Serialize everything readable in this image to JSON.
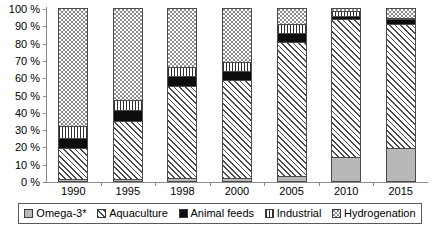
{
  "chart_data": {
    "type": "bar",
    "stacked": true,
    "title": "",
    "subtitle": "",
    "xlabel": "",
    "ylabel": "",
    "categories": [
      "1990",
      "1995",
      "1998",
      "2000",
      "2005",
      "2010",
      "2015"
    ],
    "ylim": [
      0,
      100
    ],
    "y_unit": "%",
    "y_ticks": [
      "0 %",
      "10 %",
      "20 %",
      "30 %",
      "40 %",
      "50 %",
      "60 %",
      "70 %",
      "80 %",
      "90 %",
      "100 %"
    ],
    "y_tick_values": [
      0,
      10,
      20,
      30,
      40,
      50,
      60,
      70,
      80,
      90,
      100
    ],
    "grid": false,
    "legend_position": "bottom",
    "series": [
      {
        "name": "Omega-3*",
        "fill": "omega3",
        "values": [
          1,
          1,
          2,
          2,
          3,
          14,
          19
        ]
      },
      {
        "name": "Aquaculture",
        "fill": "aquaculture",
        "values": [
          18,
          34,
          53,
          57,
          78,
          80,
          72
        ]
      },
      {
        "name": "Animal feeds",
        "fill": "animalfeeds",
        "values": [
          6,
          6,
          6,
          5,
          5,
          2,
          3
        ]
      },
      {
        "name": "Industrial",
        "fill": "industrial",
        "values": [
          7,
          6,
          5,
          5,
          5,
          3,
          1
        ]
      },
      {
        "name": "Hydrogenation",
        "fill": "hydrogenation",
        "values": [
          68,
          53,
          34,
          31,
          9,
          1,
          5
        ]
      }
    ],
    "legend": [
      {
        "label": "Omega-3*",
        "fill": "omega3"
      },
      {
        "label": "Aquaculture",
        "fill": "aquaculture"
      },
      {
        "label": "Animal feeds",
        "fill": "animalfeeds"
      },
      {
        "label": "Industrial",
        "fill": "industrial"
      },
      {
        "label": "Hydrogenation",
        "fill": "hydrogenation"
      }
    ],
    "colors": {
      "omega3": "#b8b8b8",
      "aquaculture": "#ffffff",
      "animalfeeds": "#0d0d0d",
      "industrial": "#ffffff",
      "hydrogenation": "#ffffff",
      "outline": "#4a4a4a",
      "axis": "#8a8a8a",
      "background": "#ffffff"
    }
  },
  "caption": {
    "text": ""
  }
}
